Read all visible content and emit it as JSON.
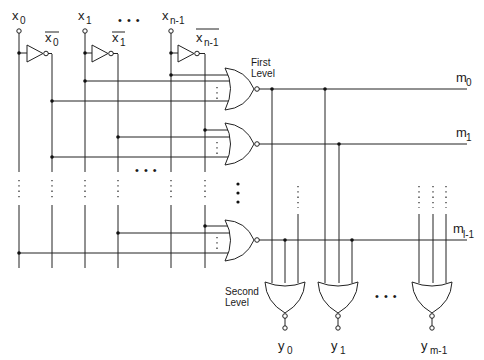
{
  "diagram": {
    "inputs": [
      {
        "label": "x",
        "sub": "0",
        "bar_label": "x",
        "bar_sub": "0"
      },
      {
        "label": "x",
        "sub": "1",
        "bar_label": "x",
        "bar_sub": "1"
      },
      {
        "label": "x",
        "sub": "n-1",
        "bar_label": "x",
        "bar_sub": "n-1"
      }
    ],
    "ellipsis": "• • •",
    "first_level": {
      "line1": "First",
      "line2": "Level"
    },
    "second_level": {
      "line1": "Second",
      "line2": "Level"
    },
    "minterms": [
      {
        "label": "m",
        "sub": "0"
      },
      {
        "label": "m",
        "sub": "1"
      },
      {
        "label": "m",
        "sub": "l-1"
      }
    ],
    "outputs": [
      {
        "label": "y",
        "sub": "0"
      },
      {
        "label": "y",
        "sub": "1"
      },
      {
        "label": "y",
        "sub": "m-1"
      }
    ],
    "colors": {
      "line": "#222222",
      "background": "#ffffff"
    }
  }
}
